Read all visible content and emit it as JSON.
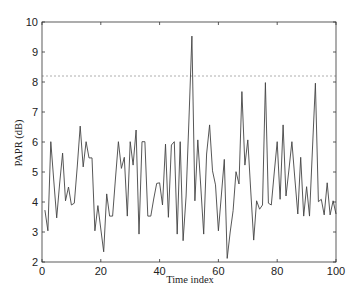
{
  "chart_data": {
    "type": "line",
    "title": "",
    "xlabel": "Time index",
    "ylabel": "PAPR (dB)",
    "xlim": [
      0,
      100
    ],
    "ylim": [
      2,
      10
    ],
    "xticks": [
      0,
      20,
      40,
      60,
      80,
      100
    ],
    "yticks": [
      2,
      3,
      4,
      5,
      6,
      7,
      8,
      9,
      10
    ],
    "grid": false,
    "legend": null,
    "threshold_line": {
      "value": 8.2,
      "style": "dashed",
      "color": "#999999"
    },
    "series": [
      {
        "name": "PAPR",
        "color": "#444444",
        "x": [
          1,
          2,
          3,
          4,
          5,
          6,
          7,
          8,
          9,
          10,
          11,
          12,
          13,
          14,
          15,
          16,
          17,
          18,
          19,
          20,
          21,
          22,
          23,
          24,
          25,
          26,
          27,
          28,
          29,
          30,
          31,
          32,
          33,
          34,
          35,
          36,
          37,
          38,
          39,
          40,
          41,
          42,
          43,
          44,
          45,
          46,
          47,
          48,
          49,
          50,
          51,
          52,
          53,
          54,
          55,
          56,
          57,
          58,
          59,
          60,
          61,
          62,
          63,
          64,
          65,
          66,
          67,
          68,
          69,
          70,
          71,
          72,
          73,
          74,
          75,
          76,
          77,
          78,
          79,
          80,
          81,
          82,
          83,
          84,
          85,
          86,
          87,
          88,
          89,
          90,
          91,
          92,
          93,
          94,
          95,
          96,
          97,
          98,
          99,
          100
        ],
        "values": [
          3.73,
          3.04,
          6.01,
          4.7,
          3.47,
          4.6,
          5.63,
          4.04,
          4.5,
          3.9,
          3.96,
          5.2,
          6.53,
          5.17,
          6.01,
          5.47,
          5.47,
          3.04,
          3.88,
          3.1,
          2.34,
          4.27,
          3.53,
          3.53,
          4.8,
          6.01,
          5.12,
          5.49,
          3.53,
          6.01,
          5.23,
          6.4,
          2.93,
          6.01,
          6.01,
          3.53,
          3.53,
          4.1,
          4.62,
          4.64,
          3.9,
          5.93,
          3.49,
          5.9,
          6.01,
          2.93,
          6.01,
          2.71,
          4.2,
          6.8,
          9.53,
          4.04,
          6.07,
          4.5,
          2.93,
          5.6,
          6.57,
          5.04,
          4.57,
          3.04,
          4.2,
          5.42,
          2.12,
          3.0,
          3.71,
          5.01,
          4.6,
          7.68,
          5.23,
          6.07,
          4.4,
          2.73,
          4.04,
          3.76,
          3.9,
          7.98,
          3.96,
          3.9,
          5.0,
          6.01,
          4.09,
          6.57,
          4.2,
          5.1,
          6.01,
          4.8,
          3.6,
          5.49,
          3.53,
          4.51,
          3.53,
          5.8,
          7.96,
          4.01,
          4.09,
          3.57,
          4.64,
          3.57,
          4.04,
          3.6
        ]
      }
    ]
  }
}
